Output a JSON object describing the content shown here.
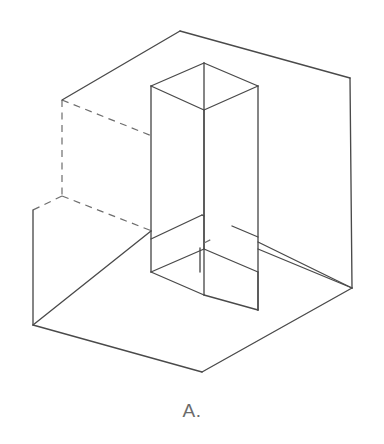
{
  "figure": {
    "caption": "A.",
    "line_color": "#4a4a4a",
    "hidden_line_color": "#6d6d6d",
    "background_color": "#ffffff",
    "caption_color": "#6b6b6b",
    "canvas": {
      "width": 384,
      "height": 444
    }
  },
  "geometry": {
    "outer_box": {
      "name": "open-box",
      "vertices": {
        "top_back": [
          180,
          31
        ],
        "top_left": [
          62,
          100
        ],
        "top_right": [
          350,
          78
        ],
        "top_front": [
          202,
          215
        ],
        "bottom_left": [
          33,
          325
        ],
        "bottom_front": [
          202,
          372
        ],
        "bottom_right": [
          352,
          288
        ],
        "bottom_back_left": [
          33,
          210
        ],
        "bottom_back_hidden": [
          62,
          196
        ]
      },
      "solid_edges": [
        [
          [
            180,
            31
          ],
          [
            62,
            100
          ]
        ],
        [
          [
            180,
            31
          ],
          [
            350,
            78
          ]
        ],
        [
          [
            350,
            78
          ],
          [
            352,
            288
          ]
        ],
        [
          [
            352,
            288
          ],
          [
            202,
            372
          ]
        ],
        [
          [
            202,
            372
          ],
          [
            33,
            325
          ]
        ],
        [
          [
            33,
            325
          ],
          [
            33,
            210
          ]
        ],
        [
          [
            202,
            215
          ],
          [
            352,
            288
          ]
        ],
        [
          [
            202,
            215
          ],
          [
            33,
            325
          ]
        ]
      ],
      "hidden_edges": [
        [
          [
            62,
            100
          ],
          [
            62,
            196
          ]
        ],
        [
          [
            62,
            100
          ],
          [
            232,
            166
          ]
        ],
        [
          [
            62,
            196
          ],
          [
            232,
            262
          ]
        ],
        [
          [
            62,
            196
          ],
          [
            33,
            210
          ]
        ],
        [
          [
            232,
            166
          ],
          [
            232,
            262
          ]
        ]
      ]
    },
    "column": {
      "name": "rectangular-column",
      "top_face": {
        "left": [
          151,
          86
        ],
        "back": [
          204,
          63
        ],
        "right": [
          258,
          86
        ],
        "front": [
          204,
          110
        ]
      },
      "bottom_face": {
        "left": [
          151,
          272
        ],
        "back": [
          204,
          249
        ],
        "right": [
          258,
          249
        ],
        "front": [
          204,
          295
        ]
      },
      "vertical_edges": [
        [
          [
            151,
            86
          ],
          [
            151,
            272
          ]
        ],
        [
          [
            204,
            63
          ],
          [
            204,
            249
          ]
        ],
        [
          [
            258,
            86
          ],
          [
            258,
            310
          ]
        ],
        [
          [
            204,
            110
          ],
          [
            204,
            295
          ]
        ]
      ],
      "hidden_vertical": [
        [
          232,
          175
        ],
        [
          232,
          262
        ]
      ]
    }
  }
}
